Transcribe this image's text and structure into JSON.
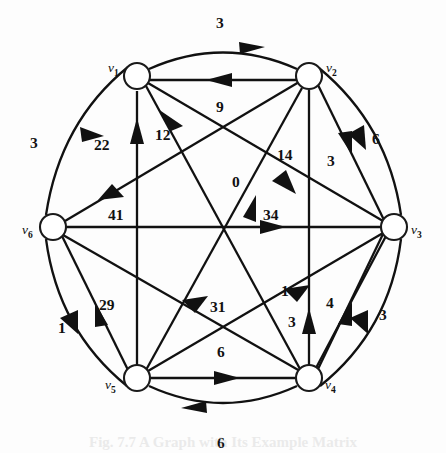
{
  "figure": {
    "caption_partial": "Fig. 7.7 A Graph with Its Example Matrix",
    "background_color": "#fdfdfd",
    "ink_color": "#111111"
  },
  "nodes": [
    {
      "id": "v1",
      "label": "v",
      "subscript": "1",
      "cx": 137,
      "cy": 76,
      "r": 13,
      "label_x": 108,
      "label_y": 70
    },
    {
      "id": "v2",
      "label": "v",
      "subscript": "2",
      "cx": 309,
      "cy": 76,
      "r": 13,
      "label_x": 328,
      "label_y": 70
    },
    {
      "id": "v3",
      "label": "v",
      "subscript": "3",
      "cx": 394,
      "cy": 227,
      "r": 13,
      "label_x": 412,
      "label_y": 232
    },
    {
      "id": "v4",
      "label": "v",
      "subscript": "4",
      "cx": 309,
      "cy": 378,
      "r": 13,
      "label_x": 326,
      "label_y": 386
    },
    {
      "id": "v5",
      "label": "v",
      "subscript": "5",
      "cx": 137,
      "cy": 378,
      "r": 13,
      "label_x": 106,
      "label_y": 386
    },
    {
      "id": "v6",
      "label": "v",
      "subscript": "6",
      "cx": 53,
      "cy": 227,
      "r": 13,
      "label_x": 24,
      "label_y": 232
    }
  ],
  "edges": [
    {
      "from": "v1",
      "to": "v2",
      "weight": "3",
      "style": "arc-outer",
      "label_x": 222,
      "label_y": 23
    },
    {
      "from": "v2",
      "to": "v1",
      "weight": "9",
      "style": "straight",
      "label_x": 222,
      "label_y": 108
    },
    {
      "from": "v6",
      "to": "v1",
      "weight": "3",
      "style": "arc-outer",
      "label_x": 37,
      "label_y": 142
    },
    {
      "from": "v5",
      "to": "v1",
      "weight": "22",
      "style": "straight",
      "label_x": 102,
      "label_y": 147
    },
    {
      "from": "v4",
      "to": "v1",
      "weight": "12",
      "style": "straight",
      "label_x": 160,
      "label_y": 137
    },
    {
      "from": "v6",
      "to": "v2",
      "weight": "41",
      "style": "straight",
      "label_x": 112,
      "label_y": 215
    },
    {
      "from": "v4",
      "to": "v2",
      "weight": "3",
      "style": "straight",
      "label_x": 332,
      "label_y": 161
    },
    {
      "from": "v2",
      "to": "v3",
      "weight": "6",
      "style": "arc-outer",
      "label_x": 372,
      "label_y": 142
    },
    {
      "from": "v5",
      "to": "v2",
      "weight": "0",
      "style": "straight",
      "label_x": 236,
      "label_y": 182
    },
    {
      "from": "v3",
      "to": "v1",
      "weight": "14",
      "style": "straight",
      "label_x": 283,
      "label_y": 155
    },
    {
      "from": "v6",
      "to": "v3",
      "weight": "34",
      "style": "straight",
      "label_x": 270,
      "label_y": 215
    },
    {
      "from": "v5",
      "to": "v3",
      "weight": "1",
      "style": "straight",
      "label_x": 284,
      "label_y": 291
    },
    {
      "from": "v6",
      "to": "v5",
      "weight": "1",
      "style": "arc-outer",
      "label_x": 64,
      "label_y": 328
    },
    {
      "from": "v5",
      "to": "v6",
      "weight": "29",
      "style": "straight",
      "label_x": 106,
      "label_y": 305
    },
    {
      "from": "v6",
      "to": "v4",
      "weight": "31",
      "style": "straight",
      "label_x": 216,
      "label_y": 307
    },
    {
      "from": "v4",
      "to": "v3",
      "weight": "4",
      "style": "straight",
      "label_x": 330,
      "label_y": 303
    },
    {
      "from": "v3",
      "to": "v4",
      "weight": "3",
      "style": "arc-outer",
      "label_x": 382,
      "label_y": 315
    },
    {
      "from": "v4",
      "to": "v2",
      "weight": "3",
      "style": "straight-v",
      "label_x": 293,
      "label_y": 322
    },
    {
      "from": "v5",
      "to": "v4",
      "weight": "6",
      "style": "straight",
      "label_x": 222,
      "label_y": 352
    },
    {
      "from": "v4",
      "to": "v5",
      "weight": "6",
      "style": "arc-outer",
      "label_x": 222,
      "label_y": 444
    }
  ],
  "weights_list": [
    "3",
    "9",
    "3",
    "22",
    "12",
    "41",
    "3",
    "6",
    "0",
    "14",
    "34",
    "1",
    "1",
    "29",
    "31",
    "4",
    "3",
    "3",
    "6",
    "6"
  ]
}
